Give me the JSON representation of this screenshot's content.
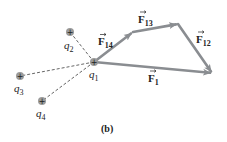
{
  "figure": {
    "caption": "(b)",
    "colors": {
      "arrow": "#8a8d91",
      "dashed_line": "#555555",
      "charge_fill": "#9a9a9a",
      "charge_sign": "#222222",
      "text": "#222222"
    },
    "charges": [
      {
        "id": "q1",
        "symbol": "q",
        "sub": "1",
        "sign": "+",
        "x": 94,
        "y": 62
      },
      {
        "id": "q2",
        "symbol": "q",
        "sub": "2",
        "sign": "+",
        "x": 70,
        "y": 32
      },
      {
        "id": "q3",
        "symbol": "q",
        "sub": "3",
        "sign": "+",
        "x": 20,
        "y": 76
      },
      {
        "id": "q4",
        "symbol": "q",
        "sub": "4",
        "sign": "+",
        "x": 42,
        "y": 101
      }
    ],
    "vectors": [
      {
        "id": "F14",
        "symbol": "F",
        "sub": "14",
        "from": [
          94,
          62
        ],
        "to": [
          133,
          32
        ]
      },
      {
        "id": "F13",
        "symbol": "F",
        "sub": "13",
        "from": [
          133,
          32
        ],
        "to": [
          178,
          24
        ]
      },
      {
        "id": "F12",
        "symbol": "F",
        "sub": "12",
        "from": [
          178,
          24
        ],
        "to": [
          212,
          73
        ]
      },
      {
        "id": "F1",
        "symbol": "F",
        "sub": "1",
        "from": [
          94,
          62
        ],
        "to": [
          212,
          73
        ]
      }
    ]
  }
}
